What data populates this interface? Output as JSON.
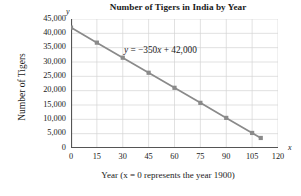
{
  "chart_data": {
    "type": "line",
    "title": "Number of Tigers in India by Year",
    "xlabel": "Year (x = 0 represents the year 1900)",
    "ylabel": "Number of Tigers",
    "x_axis_variable": "y",
    "y_axis_variable": "x",
    "axis_variable_x": "x",
    "axis_variable_y": "y",
    "xlim": [
      0,
      120
    ],
    "ylim": [
      0,
      45000
    ],
    "xticks": [
      0,
      15,
      30,
      45,
      60,
      75,
      90,
      105,
      120
    ],
    "xtick_labels": [
      "0",
      "15",
      "30",
      "45",
      "60",
      "75",
      "90",
      "105",
      "120"
    ],
    "yticks": [
      0,
      5000,
      10000,
      15000,
      20000,
      25000,
      30000,
      35000,
      40000,
      45000
    ],
    "ytick_labels": [
      "0",
      "5,000",
      "10,000",
      "15,000",
      "20,000",
      "25,000",
      "30,000",
      "35,000",
      "40,000",
      "45,000"
    ],
    "grid": true,
    "legend": "none",
    "annotation": "y = −350x + 42,000",
    "annotation_parts": {
      "lhs": "y",
      "equals": " = −350",
      "variable": "x",
      "rhs": " + 42,000"
    },
    "series": [
      {
        "name": "Number of Tigers",
        "marker": "square",
        "color": "#8a8a8a",
        "x": [
          0,
          15,
          30,
          45,
          60,
          75,
          90,
          105,
          110
        ],
        "values": [
          42000,
          36750,
          31500,
          26250,
          21000,
          15750,
          10500,
          5250,
          3500
        ]
      }
    ]
  },
  "colors": {
    "line": "#8a8a8a",
    "marker": "#8a8a8a",
    "grid": "#d4d4d4",
    "axis": "#555555",
    "text": "#1a1a1a",
    "background": "#ffffff"
  }
}
